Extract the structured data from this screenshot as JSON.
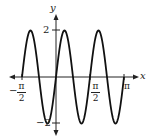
{
  "chart_data": {
    "type": "line",
    "title": "",
    "function": "y = 2 sin(4x)",
    "xlabel": "x",
    "ylabel": "y",
    "xlim": [
      -1.5708,
      3.1416
    ],
    "ylim": [
      -2,
      2
    ],
    "x_ticks": [
      {
        "value": -1.5708,
        "label_num": "π",
        "label_den": "2",
        "sign": "−"
      },
      {
        "value": 1.5708,
        "label_num": "π",
        "label_den": "2",
        "sign": ""
      },
      {
        "value": 3.1416,
        "label": "π"
      }
    ],
    "y_ticks": [
      {
        "value": 2,
        "label": "2"
      },
      {
        "value": -2,
        "label": "−2"
      }
    ],
    "series": [
      {
        "name": "curve",
        "color": "#000000",
        "x": [
          -1.5708,
          -1.1781,
          -0.7854,
          -0.3927,
          0,
          0.3927,
          0.7854,
          1.1781,
          1.5708,
          1.9635,
          2.3562,
          2.7489,
          3.1416
        ],
        "y": [
          0,
          2,
          0,
          -2,
          0,
          2,
          0,
          -2,
          0,
          2,
          0,
          -2,
          0
        ]
      }
    ],
    "grid": false,
    "legend": null
  },
  "labels": {
    "x_axis": "x",
    "y_axis": "y",
    "y_max": "2",
    "y_min": "−2",
    "neg_sign": "−",
    "pi": "π",
    "two": "2"
  }
}
